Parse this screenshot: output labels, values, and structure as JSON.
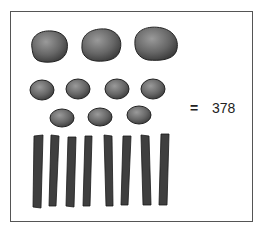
{
  "figure": {
    "groups": [
      {
        "name": "large-stones",
        "count": 3,
        "place_value": 100
      },
      {
        "name": "small-stones",
        "count": 7,
        "place_value": 10
      },
      {
        "name": "sticks",
        "count": 8,
        "place_value": 1
      }
    ],
    "equals_sign": "=",
    "total": "378"
  },
  "colors": {
    "stone": "#555555",
    "stick": "#3a3a3a",
    "border": "#555555"
  }
}
